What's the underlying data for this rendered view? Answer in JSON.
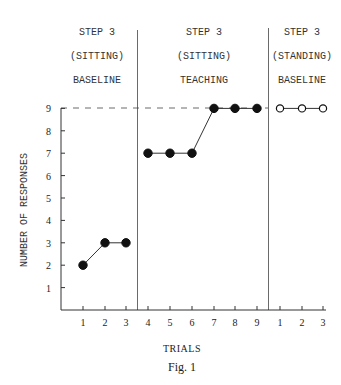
{
  "chart_data": {
    "type": "line",
    "title": "",
    "caption": "Fig. 1",
    "xlabel": "TRIALS",
    "ylabel": "NUMBER OF RESPONSES",
    "ylim": [
      0,
      9
    ],
    "yticks": [
      1,
      2,
      3,
      4,
      5,
      6,
      7,
      8,
      9
    ],
    "grid": false,
    "reference_line": {
      "y": 9,
      "style": "dashed"
    },
    "phases": [
      {
        "label_lines": [
          "STEP 3",
          "(SITTING)",
          "BASELINE"
        ],
        "trials": [
          1,
          2,
          3
        ],
        "values": [
          2,
          3,
          3
        ],
        "marker": "filled-circle"
      },
      {
        "label_lines": [
          "STEP 3",
          "(SITTING)",
          "TEACHING"
        ],
        "trials": [
          4,
          5,
          6,
          7,
          8,
          9
        ],
        "values": [
          7,
          7,
          7,
          9,
          9,
          9
        ],
        "marker": "filled-circle"
      },
      {
        "label_lines": [
          "STEP 3",
          "(STANDING)",
          "BASELINE"
        ],
        "trials": [
          1,
          2,
          3
        ],
        "values": [
          9,
          9,
          9
        ],
        "marker": "open-circle"
      }
    ],
    "x_tick_labels": [
      "1",
      "2",
      "3",
      "4",
      "5",
      "6",
      "7",
      "8",
      "9",
      "1",
      "2",
      "3"
    ]
  },
  "labels": {
    "xlabel": "TRIALS",
    "ylabel": "NUMBER OF RESPONSES",
    "caption": "Fig. 1",
    "phase1": [
      "STEP 3",
      "(SITTING)",
      "BASELINE"
    ],
    "phase2": [
      "STEP 3",
      "(SITTING)",
      "TEACHING"
    ],
    "phase3": [
      "STEP 3",
      "(STANDING)",
      "BASELINE"
    ]
  }
}
